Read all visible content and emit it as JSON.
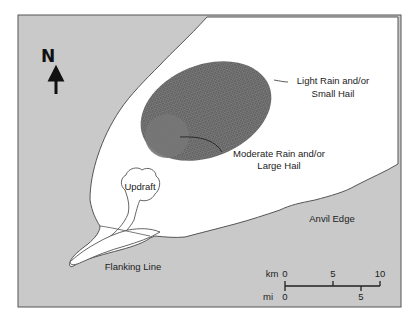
{
  "diagram": {
    "type": "supercell thunderstorm plan view",
    "north_label": "N",
    "labels": {
      "light_rain_line1": "Light Rain and/or",
      "light_rain_line2": "Small Hail",
      "moderate_rain_line1": "Moderate Rain and/or",
      "moderate_rain_line2": "Large Hail",
      "updraft": "Updraft",
      "anvil_edge": "Anvil Edge",
      "flanking_line": "Flanking Line"
    },
    "scale": {
      "km_label": "km",
      "mi_label": "mi",
      "km_ticks": [
        "0",
        "5",
        "10"
      ],
      "mi_ticks": [
        "0",
        "5"
      ]
    },
    "colors": {
      "background": "#c9c9c9",
      "anvil": "#ffffff",
      "light_rain": "#6e6e6e",
      "moderate_rain": "#7a7a7a",
      "outline": "#444444"
    }
  }
}
